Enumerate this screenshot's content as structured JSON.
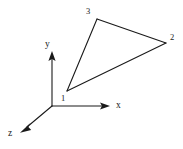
{
  "figure": {
    "background_color": "#ffffff",
    "line_color": "#1a1a1a",
    "width": 183,
    "height": 149
  },
  "axes": [
    {
      "name": "x",
      "label": "x",
      "label_x": 116,
      "label_y": 101,
      "from": [
        52,
        106
      ],
      "to": [
        107,
        106
      ],
      "arrow_angle_deg": 0
    },
    {
      "name": "y",
      "label": "y",
      "label_x": 45,
      "label_y": 40,
      "from": [
        52,
        106
      ],
      "to": [
        52,
        53
      ],
      "arrow_angle_deg": 270
    },
    {
      "name": "z",
      "label": "z",
      "label_x": 8,
      "label_y": 129,
      "from": [
        52,
        106
      ],
      "to": [
        23,
        130
      ],
      "arrow_angle_deg": 140
    }
  ],
  "origin": {
    "name": "origin",
    "x": 52,
    "y": 106
  },
  "element": {
    "shape": "triangle",
    "vertices": [
      {
        "label": "1",
        "x": 67,
        "y": 91,
        "label_x": 61,
        "label_y": 94
      },
      {
        "label": "2",
        "x": 166,
        "y": 43,
        "label_x": 170,
        "label_y": 33
      },
      {
        "label": "3",
        "x": 97,
        "y": 19,
        "label_x": 86,
        "label_y": 7
      }
    ],
    "edges": [
      {
        "name": "edge-1-3",
        "from": 0,
        "to": 2
      },
      {
        "name": "edge-3-2",
        "from": 2,
        "to": 1
      },
      {
        "name": "edge-2-1",
        "from": 1,
        "to": 0
      }
    ]
  }
}
